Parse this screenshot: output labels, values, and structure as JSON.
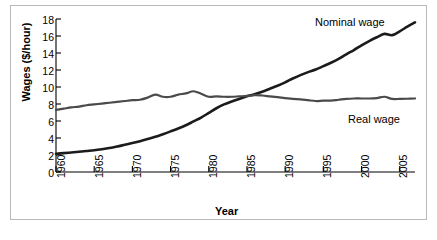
{
  "chart_data": {
    "type": "line",
    "title": "",
    "xlabel": "Year",
    "ylabel": "Wages ($/hour)",
    "xlim": [
      1960,
      2007
    ],
    "ylim": [
      0,
      18
    ],
    "grid": false,
    "legend_position": "inline-annotation",
    "xticks": [
      "1960",
      "1965",
      "1970",
      "1975",
      "1980",
      "1985",
      "1990",
      "1995",
      "2000",
      "2005"
    ],
    "xtick_values": [
      1960,
      1965,
      1970,
      1975,
      1980,
      1985,
      1990,
      1995,
      2000,
      2005
    ],
    "yticks": [
      "0",
      "2",
      "4",
      "6",
      "8",
      "10",
      "12",
      "14",
      "16",
      "18"
    ],
    "ytick_values": [
      0,
      2,
      4,
      6,
      8,
      10,
      12,
      14,
      16,
      18
    ],
    "x": [
      1960,
      1961,
      1962,
      1963,
      1964,
      1965,
      1966,
      1967,
      1968,
      1969,
      1970,
      1971,
      1972,
      1973,
      1974,
      1975,
      1976,
      1977,
      1978,
      1979,
      1980,
      1981,
      1982,
      1983,
      1984,
      1985,
      1986,
      1987,
      1988,
      1989,
      1990,
      1991,
      1992,
      1993,
      1994,
      1995,
      1996,
      1997,
      1998,
      1999,
      2000,
      2001,
      2002,
      2003,
      2004,
      2005,
      2006,
      2007
    ],
    "series": [
      {
        "name": "Nominal wage",
        "color": "#1b1b1b",
        "values": [
          2.15,
          2.22,
          2.3,
          2.38,
          2.47,
          2.56,
          2.68,
          2.82,
          3.0,
          3.2,
          3.4,
          3.63,
          3.88,
          4.14,
          4.45,
          4.78,
          5.12,
          5.5,
          5.95,
          6.4,
          6.95,
          7.5,
          7.95,
          8.3,
          8.6,
          8.9,
          9.15,
          9.45,
          9.8,
          10.15,
          10.55,
          11.0,
          11.4,
          11.75,
          12.05,
          12.45,
          12.85,
          13.3,
          13.85,
          14.35,
          14.9,
          15.4,
          15.85,
          16.25,
          16.1,
          16.55,
          17.1,
          17.6
        ]
      },
      {
        "name": "Real wage",
        "color": "#4a4a4a",
        "values": [
          7.3,
          7.45,
          7.6,
          7.7,
          7.85,
          7.95,
          8.05,
          8.15,
          8.25,
          8.35,
          8.45,
          8.5,
          8.75,
          9.1,
          8.85,
          8.85,
          9.1,
          9.25,
          9.5,
          9.2,
          8.85,
          8.9,
          8.85,
          8.85,
          8.9,
          8.95,
          9.05,
          9.0,
          8.9,
          8.8,
          8.7,
          8.6,
          8.55,
          8.45,
          8.35,
          8.4,
          8.4,
          8.5,
          8.6,
          8.65,
          8.65,
          8.65,
          8.7,
          8.85,
          8.6,
          8.6,
          8.62,
          8.65
        ]
      }
    ],
    "annotations": [
      {
        "text": "Nominal wage",
        "x": 1998,
        "y": 17.6
      },
      {
        "text": "Real wage",
        "x": 2000,
        "y": 7.1
      }
    ]
  },
  "axes": {
    "y_axis_title": "Wages ($/hour)",
    "x_axis_title": "Year"
  }
}
